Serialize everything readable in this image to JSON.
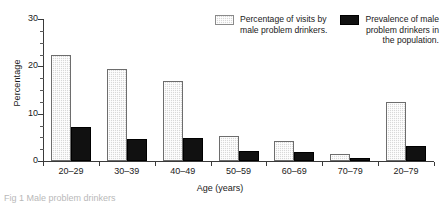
{
  "chart_data": {
    "type": "bar",
    "title": "",
    "xlabel": "Age (years)",
    "ylabel": "Percentage",
    "categories": [
      "20–29",
      "30–39",
      "40–49",
      "50–59",
      "60–69",
      "70–79",
      "20–79"
    ],
    "series": [
      {
        "name": "Percentage of visits by male problem drinkers.",
        "key": "visits",
        "color": "#d8d8d8",
        "values": [
          22.5,
          19.5,
          16.9,
          5.3,
          4.2,
          1.5,
          12.5
        ]
      },
      {
        "name": "Prevalence of male problem drinkers in the population.",
        "key": "prevalence",
        "color": "#111111",
        "values": [
          7.1,
          4.7,
          4.9,
          2.2,
          2.0,
          0.6,
          3.2
        ]
      }
    ],
    "ylim": [
      0,
      30
    ],
    "y_major_ticks": [
      0,
      10,
      20,
      30
    ],
    "y_minor_step": 2.5,
    "y_tick_labels": [
      "0",
      "10",
      "20",
      "30"
    ],
    "grid": false,
    "legend_position": "top-right"
  },
  "legend": {
    "entries": [
      {
        "label": "Percentage of visits by male problem drinkers.",
        "swatch": "light-stipple-swatch"
      },
      {
        "label": "Prevalence of male problem drinkers in the population.",
        "swatch": "black-solid-swatch"
      }
    ]
  },
  "caption": {
    "text": "Fig 1 Male problem drinkers"
  }
}
